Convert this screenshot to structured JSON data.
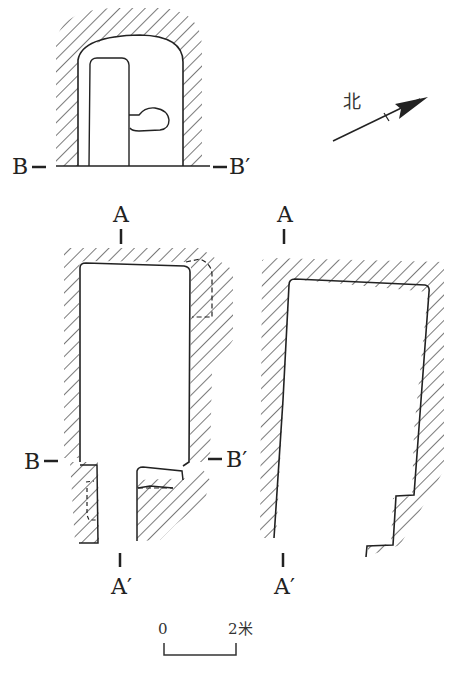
{
  "diagram": {
    "type": "archaeological tomb plan and sections",
    "north_label": "北",
    "top_view": {
      "section_left": "B",
      "section_right": "B′"
    },
    "plan_view": {
      "top_marker": "A",
      "bottom_marker": "A′",
      "section_left": "B",
      "section_right": "B′"
    },
    "profile_view": {
      "top_marker": "A",
      "bottom_marker": "A′"
    },
    "scale_bar": {
      "start": "0",
      "end": "2米"
    },
    "colors": {
      "line": "#222222",
      "background": "#ffffff"
    }
  }
}
